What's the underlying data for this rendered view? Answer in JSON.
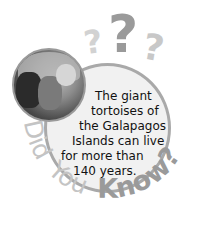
{
  "graphic": {
    "question_marks": [
      "?",
      "?",
      "?"
    ],
    "fact_lines": [
      "The giant",
      "tortoises of",
      "the Galapagos",
      "Islands can live",
      "for more than",
      "140 years."
    ],
    "arc_words": {
      "did": "Did",
      "you": "You",
      "know": "Know?"
    },
    "image_alt": "Galapagos tortoise photo",
    "colors": {
      "circle_fill": "#f1f1f1",
      "circle_border": "#a9a9a9",
      "light_text": "#c4c4c4",
      "know_text": "#9a9a9a",
      "body_text": "#111111"
    }
  }
}
